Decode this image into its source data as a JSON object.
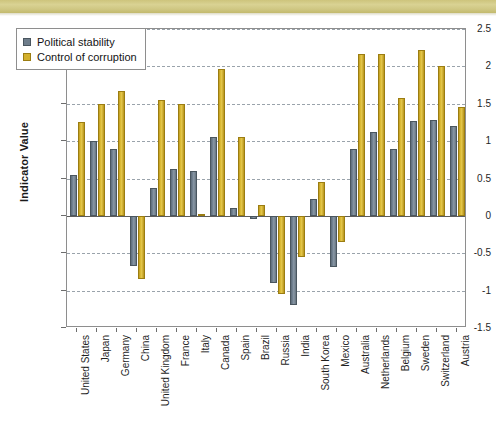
{
  "banner": {
    "name": "decorative-top-strip",
    "color": "#cfc783"
  },
  "chart_data": {
    "type": "bar",
    "title": "",
    "xlabel": "",
    "ylabel": "Indicator Value",
    "ylim": [
      -1.5,
      2.5
    ],
    "ytick_step": 0.5,
    "yticks": [
      "2.5",
      "2",
      "1.5",
      "1",
      "0.5",
      "0",
      "-0.5",
      "-1",
      "-1.5"
    ],
    "ytick_values": [
      2.5,
      2,
      1.5,
      1,
      0.5,
      0,
      -0.5,
      -1,
      -1.5
    ],
    "grid": true,
    "grid_style": "dashed-horizontal",
    "legend_position": "top-left-inside",
    "categories": [
      "United States",
      "Japan",
      "Germany",
      "China",
      "United Kingdom",
      "France",
      "Italy",
      "Canada",
      "Spain",
      "Brazil",
      "Russia",
      "India",
      "South Korea",
      "Mexico",
      "Australia",
      "Netherlands",
      "Belgium",
      "Sweden",
      "Switzerland",
      "Austria"
    ],
    "series": [
      {
        "name": "Political stability",
        "color": "#6e7d8b",
        "values": [
          0.55,
          1.0,
          0.9,
          -0.67,
          0.37,
          0.63,
          0.6,
          1.05,
          0.1,
          -0.04,
          -0.9,
          -1.19,
          0.22,
          -0.69,
          0.9,
          1.12,
          0.9,
          1.27,
          1.28,
          1.2
        ]
      },
      {
        "name": "Control of corruption",
        "color": "#d3b02c",
        "values": [
          1.25,
          1.5,
          1.67,
          -0.85,
          1.55,
          1.5,
          0.02,
          1.97,
          1.06,
          0.15,
          -1.05,
          -0.55,
          0.45,
          -0.35,
          2.16,
          2.16,
          1.58,
          2.22,
          2.0,
          1.45
        ]
      }
    ]
  }
}
